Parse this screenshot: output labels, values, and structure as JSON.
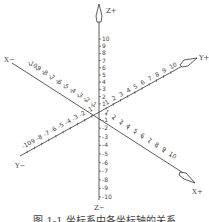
{
  "diagram": {
    "type": "3d-coordinate-axes",
    "origin_label": "0",
    "axes": {
      "z_plus": {
        "label": "Z+",
        "ticks": [
          "1",
          "2",
          "3",
          "4",
          "5",
          "6",
          "7",
          "8",
          "9",
          "10"
        ]
      },
      "z_minus": {
        "label": "Z−",
        "ticks": [
          "-1",
          "-2",
          "-3",
          "-4",
          "-5",
          "-6",
          "-7",
          "-8",
          "-9",
          "-10"
        ]
      },
      "x_minus": {
        "label": "X−",
        "ticks": [
          "-1",
          "-2",
          "-3",
          "-4",
          "-5",
          "-6",
          "-7",
          "-8",
          "-9",
          "-10"
        ]
      },
      "x_plus": {
        "label": "X+",
        "ticks": [
          "1",
          "2",
          "3",
          "4",
          "5",
          "6",
          "7",
          "8",
          "9",
          "10"
        ]
      },
      "y_plus": {
        "label": "Y+",
        "ticks": [
          "1",
          "2",
          "3",
          "4",
          "5",
          "6",
          "7",
          "8",
          "9",
          "10"
        ]
      },
      "y_minus": {
        "label": "Y−",
        "ticks": [
          "-1",
          "-2",
          "-3",
          "-4",
          "-5",
          "-6",
          "-7",
          "-8",
          "-9",
          "-10"
        ]
      }
    },
    "caption": "图 1-1 坐标系中各坐标轴的关系"
  },
  "colors": {
    "line": "#333333",
    "text": "#444444",
    "background": "#ffffff"
  }
}
